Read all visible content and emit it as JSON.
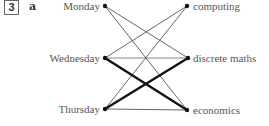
{
  "question": {
    "number": "3",
    "part": "a"
  },
  "diagram": {
    "type": "bipartite-graph",
    "left_nodes": [
      {
        "id": "monday",
        "label": "Monday",
        "x": 105,
        "y": 6
      },
      {
        "id": "wednesday",
        "label": "Wednesday",
        "x": 105,
        "y": 58
      },
      {
        "id": "thursday",
        "label": "Thursday",
        "x": 105,
        "y": 109
      }
    ],
    "right_nodes": [
      {
        "id": "computing",
        "label": "computing",
        "x": 187,
        "y": 6
      },
      {
        "id": "discrete_maths",
        "label": "discrete maths",
        "x": 188,
        "y": 58
      },
      {
        "id": "economics",
        "label": "economics",
        "x": 187,
        "y": 110
      }
    ],
    "edges": [
      {
        "from": "monday",
        "to": "discrete_maths",
        "weight": "thin"
      },
      {
        "from": "monday",
        "to": "economics",
        "weight": "thin"
      },
      {
        "from": "wednesday",
        "to": "computing",
        "weight": "thin"
      },
      {
        "from": "wednesday",
        "to": "discrete_maths",
        "weight": "thin-grey"
      },
      {
        "from": "wednesday",
        "to": "economics",
        "weight": "thick"
      },
      {
        "from": "thursday",
        "to": "computing",
        "weight": "thin"
      },
      {
        "from": "thursday",
        "to": "discrete_maths",
        "weight": "thick"
      },
      {
        "from": "thursday",
        "to": "economics",
        "weight": "thin"
      }
    ],
    "colors": {
      "thin_edge": "#555555",
      "grey_edge": "#8a8a8a",
      "thick_edge": "#111111",
      "node": "#111111",
      "label": "#555555"
    }
  }
}
